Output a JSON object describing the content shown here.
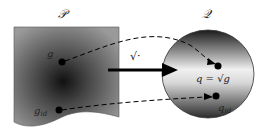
{
  "diagram": {
    "left_space_label": "𝒫",
    "right_space_label": "𝒬",
    "map_label": "√·",
    "point_g_label": "g",
    "point_gid_label": "g",
    "point_gid_sub": "id",
    "point_q_label": "q = √g",
    "point_qid_label": "q",
    "point_qid_sub": "id",
    "colors": {
      "left_sheet_dark": "#1a1a1a",
      "left_sheet_light": "#8a8a8a",
      "right_disk_dark": "#1e1e1e",
      "right_disk_light": "#e8e8e8",
      "arrow": "#000000"
    }
  }
}
